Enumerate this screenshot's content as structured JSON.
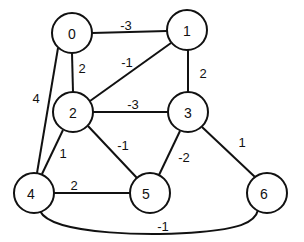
{
  "diagram": {
    "type": "weighted-undirected-graph",
    "nodes": [
      {
        "id": "0",
        "label": "0",
        "cx": 72,
        "cy": 33,
        "r": 20
      },
      {
        "id": "1",
        "label": "1",
        "cx": 187,
        "cy": 30,
        "r": 20
      },
      {
        "id": "2",
        "label": "2",
        "cx": 73,
        "cy": 112,
        "r": 20
      },
      {
        "id": "3",
        "label": "3",
        "cx": 188,
        "cy": 112,
        "r": 20
      },
      {
        "id": "4",
        "label": "4",
        "cx": 34,
        "cy": 193,
        "r": 20
      },
      {
        "id": "5",
        "label": "5",
        "cx": 150,
        "cy": 193,
        "r": 20
      },
      {
        "id": "6",
        "label": "6",
        "cx": 267,
        "cy": 193,
        "r": 20
      }
    ],
    "edges": [
      {
        "from": "0",
        "to": "1",
        "weight": "-3",
        "label_x": 126,
        "label_y": 25
      },
      {
        "from": "0",
        "to": "2",
        "weight": "2",
        "label_x": 82,
        "label_y": 68
      },
      {
        "from": "0",
        "to": "4",
        "weight": "4",
        "label_x": 36,
        "label_y": 98
      },
      {
        "from": "1",
        "to": "2",
        "weight": "-1",
        "label_x": 127,
        "label_y": 62
      },
      {
        "from": "1",
        "to": "3",
        "weight": "2",
        "label_x": 203,
        "label_y": 73
      },
      {
        "from": "2",
        "to": "3",
        "weight": "-3",
        "label_x": 133,
        "label_y": 104
      },
      {
        "from": "2",
        "to": "4",
        "weight": "1",
        "label_x": 63,
        "label_y": 153
      },
      {
        "from": "2",
        "to": "5",
        "weight": "-1",
        "label_x": 123,
        "label_y": 145
      },
      {
        "from": "3",
        "to": "5",
        "weight": "-2",
        "label_x": 184,
        "label_y": 157
      },
      {
        "from": "3",
        "to": "6",
        "weight": "1",
        "label_x": 242,
        "label_y": 142
      },
      {
        "from": "4",
        "to": "5",
        "weight": "2",
        "label_x": 74,
        "label_y": 185
      },
      {
        "from": "4",
        "to": "6",
        "weight": "-1",
        "label_x": 163,
        "label_y": 226,
        "curved": true
      }
    ]
  }
}
